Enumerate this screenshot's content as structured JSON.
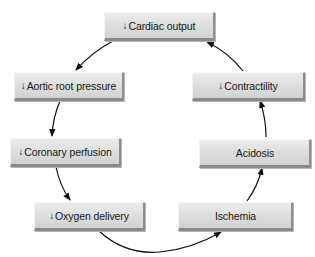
{
  "diagram": {
    "type": "cycle",
    "direction": "clockwise",
    "colors": {
      "box_fill": "#dcdcdc",
      "box_shadow": "#8a8a8a",
      "arrow": "#111111",
      "background": "#ffffff"
    },
    "decrease_symbol": "↓",
    "nodes": [
      {
        "id": "cardiac-output",
        "prefix": "↓",
        "label": "Cardiac output"
      },
      {
        "id": "aortic-root-pressure",
        "prefix": "↓",
        "label": "Aortic root pressure"
      },
      {
        "id": "coronary-perfusion",
        "prefix": "↓",
        "label": "Coronary perfusion"
      },
      {
        "id": "oxygen-delivery",
        "prefix": "↓",
        "label": "Oxygen delivery"
      },
      {
        "id": "ischemia",
        "prefix": "",
        "label": "Ischemia"
      },
      {
        "id": "acidosis",
        "prefix": "",
        "label": "Acidosis"
      },
      {
        "id": "contractility",
        "prefix": "↓",
        "label": "Contractility"
      }
    ],
    "edges": [
      {
        "from": "cardiac-output",
        "to": "aortic-root-pressure"
      },
      {
        "from": "aortic-root-pressure",
        "to": "coronary-perfusion"
      },
      {
        "from": "coronary-perfusion",
        "to": "oxygen-delivery"
      },
      {
        "from": "oxygen-delivery",
        "to": "ischemia"
      },
      {
        "from": "ischemia",
        "to": "acidosis"
      },
      {
        "from": "acidosis",
        "to": "contractility"
      },
      {
        "from": "contractility",
        "to": "cardiac-output"
      }
    ]
  }
}
